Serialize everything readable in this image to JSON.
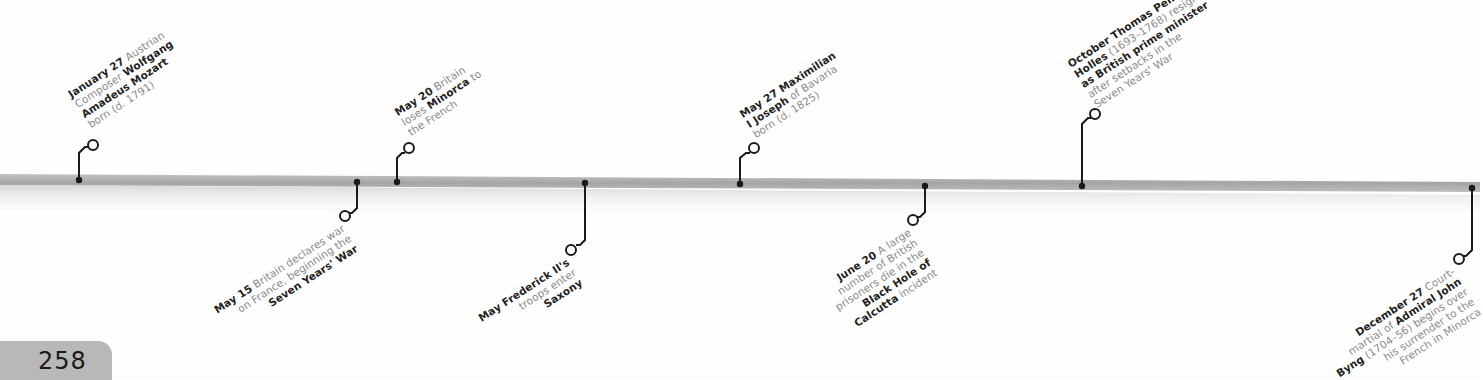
{
  "page": {
    "number": "258"
  },
  "colors": {
    "bar": "#a9a9a9",
    "connector": "#1a1a1a",
    "label_text": "#8a8a8a",
    "label_bold": "#222222",
    "page_tab": "#b8b8b8"
  },
  "events": [
    {
      "date": "January 27",
      "parts": [
        [
          "b",
          "January 27"
        ],
        [
          "t",
          " Austrian"
        ],
        [
          "br"
        ],
        [
          "t",
          "Composer "
        ],
        [
          "b",
          "Wolfgang"
        ],
        [
          "br"
        ],
        [
          "b",
          "Amadeus Mozart"
        ],
        [
          "br"
        ],
        [
          "t",
          "born (d. 1791)"
        ]
      ],
      "side": "above"
    },
    {
      "date": "May 15",
      "side": "below"
    },
    {
      "date": "May 20",
      "side": "above"
    },
    {
      "date": "May",
      "side": "below"
    },
    {
      "date": "May 27",
      "side": "above"
    },
    {
      "date": "June 20",
      "side": "below"
    },
    {
      "date": "October",
      "side": "above"
    },
    {
      "date": "December 27",
      "side": "below"
    }
  ],
  "e0": {
    "date": "January 27",
    "l1": " Austrian",
    "l2a": "Composer ",
    "l2b": "Wolfgang",
    "l3": "Amadeus Mozart",
    "l4": "born (d. 1791)"
  },
  "e1": {
    "date": "May 15",
    "l1": " Britain declares war",
    "l2": "on France, beginning the",
    "l3": "Seven Years' War"
  },
  "e2": {
    "date": "May 20",
    "l1": " Britain",
    "l2a": "loses ",
    "l2b": "Minorca",
    "l2c": " to",
    "l3": "the French"
  },
  "e3": {
    "date": "May",
    "l1b": " Frederick II's",
    "l2": "troops enter",
    "l3": "Saxony"
  },
  "e4": {
    "date": "May 27",
    "l1b": " Maximilian",
    "l2b": "I Joseph",
    "l2": " of Bavaria",
    "l3": "born (d. 1825)"
  },
  "e5": {
    "date": "June 20",
    "l1": " A large",
    "l2": "number of British",
    "l3": "prisoners die in the",
    "l4": "Black Hole of",
    "l5b": "Calcutta",
    "l5": " incident"
  },
  "e6": {
    "date": "October",
    "l1b": " Thomas Pelham-",
    "l2b": "Holles",
    "l2": " (1693–1768) resigns",
    "l3": "as British prime minister",
    "l4": "after setbacks in the",
    "l5": "Seven Years' War"
  },
  "e7": {
    "date": "December 27",
    "l1": " Court-",
    "l2a": "martial of ",
    "l2b": "Admiral John",
    "l3b": "Byng",
    "l3": " (1704–56) begins over",
    "l4": "his surrender to the",
    "l5": "French in Minorca"
  }
}
